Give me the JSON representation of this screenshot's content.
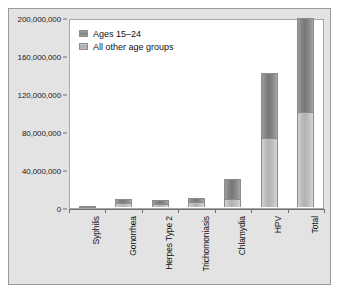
{
  "chart_data": {
    "type": "bar",
    "subtype": "stacked-bar",
    "title": "",
    "xlabel": "",
    "ylabel": "",
    "ylim": [
      0,
      200000000
    ],
    "grid": false,
    "legend_position": "top-left",
    "categories": [
      "Syphilis",
      "Gonorrhea",
      "Herpes Type 2",
      "Trichomoniasis",
      "Chlamydia",
      "HPV",
      "Total"
    ],
    "yticks": [
      0,
      40000000,
      80000000,
      120000000,
      160000000,
      200000000
    ],
    "ytick_labels": [
      "0",
      "40,000,000",
      "80,000,000",
      "120,000,000",
      "160,000,000",
      "200,000,000"
    ],
    "series": [
      {
        "name": "All other age groups",
        "values": [
          1000000,
          4000000,
          3500000,
          5000000,
          8000000,
          73000000,
          100000000
        ]
      },
      {
        "name": "Ages 15–24",
        "values": [
          500000,
          4000000,
          3500000,
          5000000,
          22000000,
          68000000,
          99000000
        ]
      }
    ],
    "totals": [
      1500000,
      8000000,
      7000000,
      10000000,
      30000000,
      141000000,
      199000000
    ],
    "colors": {
      "ages_15_24": "#8a8a8a",
      "all_other_age_groups": "#c2c2c2",
      "plot_background": "#ffffff",
      "figure_background": "#e3e3e3",
      "axis": "#6e6e6e",
      "text": "#111111"
    }
  },
  "legend": {
    "items": [
      {
        "label": "Ages 15–24",
        "swatch": "dark"
      },
      {
        "label": "All other age groups",
        "swatch": "light"
      }
    ]
  }
}
